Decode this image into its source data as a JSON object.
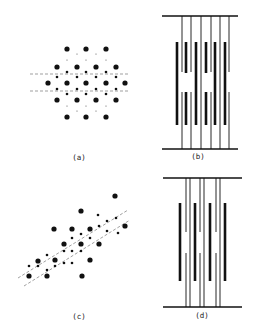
{
  "figure": {
    "background": "#ffffff",
    "ink": "#111111",
    "panels": [
      {
        "id": "a",
        "label": "(a)",
        "type": "dot-lattice",
        "description": "hexagonal diffraction-like dot pattern with two horizontal dashed lines",
        "large_dots": [
          [
            67,
            49
          ],
          [
            86,
            49
          ],
          [
            106,
            49
          ],
          [
            57,
            67
          ],
          [
            77,
            67
          ],
          [
            96,
            67
          ],
          [
            116,
            67
          ],
          [
            48,
            83
          ],
          [
            67,
            83
          ],
          [
            86,
            83
          ],
          [
            106,
            83
          ],
          [
            125,
            83
          ],
          [
            57,
            100
          ],
          [
            77,
            100
          ],
          [
            96,
            100
          ],
          [
            116,
            100
          ],
          [
            67,
            117
          ],
          [
            86,
            117
          ],
          [
            106,
            117
          ]
        ],
        "small_dots": [
          [
            67,
            72
          ],
          [
            86,
            72
          ],
          [
            106,
            72
          ],
          [
            57,
            77
          ],
          [
            77,
            77
          ],
          [
            96,
            77
          ],
          [
            116,
            77
          ],
          [
            57,
            89
          ],
          [
            77,
            89
          ],
          [
            96,
            89
          ],
          [
            116,
            89
          ],
          [
            67,
            94
          ],
          [
            86,
            94
          ],
          [
            106,
            94
          ]
        ],
        "tiny_dots": [
          [
            77,
            54
          ],
          [
            96,
            54
          ],
          [
            67,
            60
          ],
          [
            86,
            60
          ],
          [
            106,
            60
          ],
          [
            67,
            106
          ],
          [
            86,
            106
          ],
          [
            106,
            106
          ],
          [
            77,
            111
          ],
          [
            96,
            111
          ]
        ],
        "dashed_lines": [
          [
            30,
            74,
            128,
            74
          ],
          [
            30,
            91,
            128,
            91
          ]
        ]
      },
      {
        "id": "b",
        "label": "(b)",
        "type": "bar-schematic",
        "top_bar": [
          162,
          16,
          238,
          16
        ],
        "bottom_bar": [
          162,
          149,
          238,
          149
        ],
        "thin_lines_x": [
          182,
          191,
          201,
          211,
          220,
          229
        ],
        "thick_bars": [
          {
            "x": 177,
            "y1": 42,
            "y2": 125
          },
          {
            "x": 186,
            "y1": 42,
            "y2": 73
          },
          {
            "x": 186,
            "y1": 92,
            "y2": 125
          },
          {
            "x": 196,
            "y1": 42,
            "y2": 125
          },
          {
            "x": 206,
            "y1": 42,
            "y2": 73
          },
          {
            "x": 206,
            "y1": 92,
            "y2": 125
          },
          {
            "x": 215,
            "y1": 42,
            "y2": 125
          },
          {
            "x": 225,
            "y1": 42,
            "y2": 125
          }
        ],
        "thin_gaps": [
          {
            "x": 182,
            "y1": 72,
            "y2": 92
          },
          {
            "x": 191,
            "y1": 72,
            "y2": 92
          },
          {
            "x": 211,
            "y1": 72,
            "y2": 92
          },
          {
            "x": 229,
            "y1": 72,
            "y2": 92
          }
        ]
      },
      {
        "id": "c",
        "label": "(c)",
        "type": "dot-lattice",
        "description": "sheared dot pattern aligned along a diagonal with two dashed diagonal lines",
        "large_dots": [
          [
            81,
            211
          ],
          [
            115,
            196
          ],
          [
            125,
            226
          ],
          [
            54,
            229
          ],
          [
            72,
            229
          ],
          [
            90,
            229
          ],
          [
            99,
            244
          ],
          [
            64,
            244
          ],
          [
            81,
            244
          ],
          [
            55,
            260
          ],
          [
            90,
            260
          ],
          [
            38,
            261
          ],
          [
            29,
            276
          ],
          [
            47,
            276
          ],
          [
            82,
            276
          ]
        ],
        "small_dots": [
          [
            81,
            234
          ],
          [
            90,
            238
          ],
          [
            72,
            238
          ],
          [
            99,
            226
          ],
          [
            107,
            221
          ],
          [
            116,
            218
          ],
          [
            107,
            231
          ],
          [
            118,
            233
          ],
          [
            98,
            215
          ],
          [
            64,
            251
          ],
          [
            72,
            251
          ],
          [
            81,
            251
          ],
          [
            47,
            255
          ],
          [
            38,
            266
          ],
          [
            55,
            266
          ],
          [
            64,
            263
          ],
          [
            29,
            266
          ],
          [
            47,
            270
          ],
          [
            72,
            263
          ]
        ],
        "dashed_lines": [
          [
            18,
            278,
            128,
            210
          ],
          [
            24,
            286,
            130,
            220
          ]
        ]
      },
      {
        "id": "d",
        "label": "(d)",
        "type": "bar-schematic",
        "top_bar": [
          163,
          178,
          242,
          178
        ],
        "bottom_bar": [
          163,
          307,
          242,
          307
        ],
        "thin_lines_x": [
          186,
          190,
          200,
          204,
          216,
          220
        ],
        "thick_bars": [
          {
            "x": 180,
            "y1": 203,
            "y2": 281
          },
          {
            "x": 195,
            "y1": 203,
            "y2": 281
          },
          {
            "x": 210,
            "y1": 203,
            "y2": 281
          },
          {
            "x": 225,
            "y1": 203,
            "y2": 281
          }
        ],
        "thin_gaps": [
          {
            "x": 186,
            "y1": 232,
            "y2": 253
          },
          {
            "x": 200,
            "y1": 232,
            "y2": 253
          },
          {
            "x": 216,
            "y1": 232,
            "y2": 253
          }
        ]
      }
    ],
    "labels": [
      {
        "text": "(a)",
        "x": 79,
        "y": 160
      },
      {
        "text": "(b)",
        "x": 198,
        "y": 159
      },
      {
        "text": "(c)",
        "x": 79,
        "y": 319
      },
      {
        "text": "(d)",
        "x": 202,
        "y": 318
      }
    ]
  }
}
